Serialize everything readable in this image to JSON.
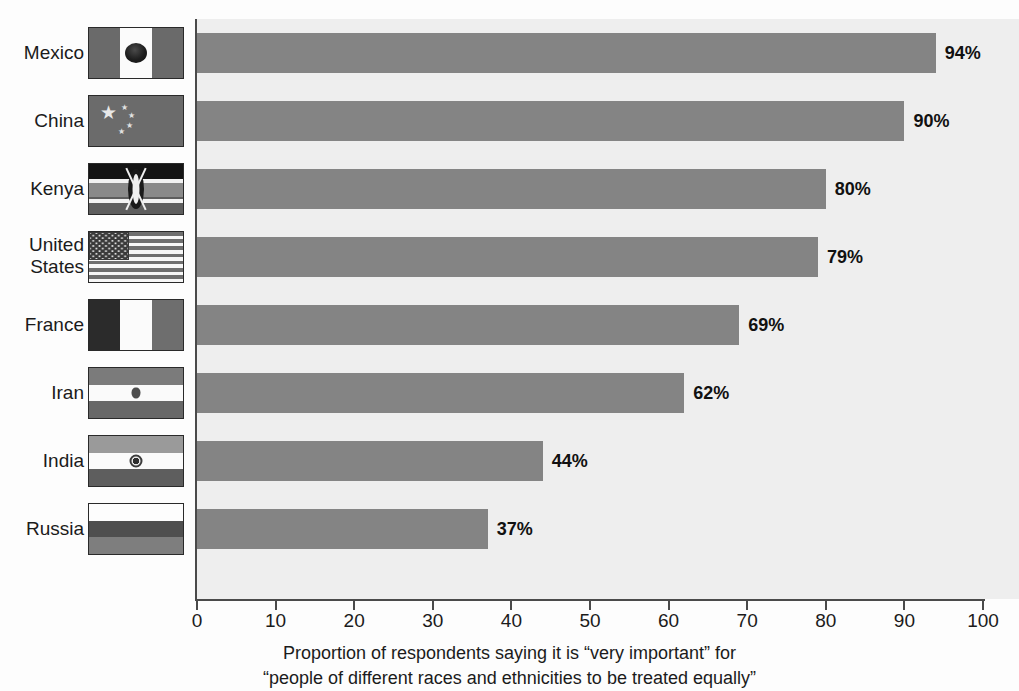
{
  "chart_data": {
    "type": "bar",
    "orientation": "horizontal",
    "title": "",
    "categories": [
      "Mexico",
      "China",
      "Kenya",
      "United States",
      "France",
      "Iran",
      "India",
      "Russia"
    ],
    "values": [
      94,
      90,
      80,
      79,
      69,
      62,
      44,
      37
    ],
    "value_labels": [
      "94%",
      "90%",
      "80%",
      "79%",
      "69%",
      "62%",
      "44%",
      "37%"
    ],
    "xlabel": "Proportion of respondents saying it is “very important” for “people of different races and ethnicities to be treated equally”",
    "ylabel": "",
    "xlim": [
      0,
      100
    ],
    "xticks": [
      0,
      10,
      20,
      30,
      40,
      50,
      60,
      70,
      80,
      90,
      100
    ],
    "xtick_labels": [
      "0",
      "10",
      "20",
      "30",
      "40",
      "50",
      "60",
      "70",
      "80",
      "90",
      "100"
    ],
    "grid": false,
    "legend": "none",
    "bar_color": "#848484",
    "plot_background": "#eeeeee"
  },
  "caption": {
    "line1": "Proportion of respondents saying it is “very important” for",
    "line2": "“people of different races and ethnicities to be treated equally”"
  },
  "rows": [
    {
      "country": "Mexico",
      "country_line1": "Mexico",
      "country_line2": "",
      "value": 94,
      "label": "94%",
      "flag": "flag-mexico"
    },
    {
      "country": "China",
      "country_line1": "China",
      "country_line2": "",
      "value": 90,
      "label": "90%",
      "flag": "flag-china"
    },
    {
      "country": "Kenya",
      "country_line1": "Kenya",
      "country_line2": "",
      "value": 80,
      "label": "80%",
      "flag": "flag-kenya"
    },
    {
      "country": "United States",
      "country_line1": "United",
      "country_line2": "States",
      "value": 79,
      "label": "79%",
      "flag": "flag-usa"
    },
    {
      "country": "France",
      "country_line1": "France",
      "country_line2": "",
      "value": 69,
      "label": "69%",
      "flag": "flag-france"
    },
    {
      "country": "Iran",
      "country_line1": "Iran",
      "country_line2": "",
      "value": 62,
      "label": "62%",
      "flag": "flag-iran"
    },
    {
      "country": "India",
      "country_line1": "India",
      "country_line2": "",
      "value": 44,
      "label": "44%",
      "flag": "flag-india"
    },
    {
      "country": "Russia",
      "country_line1": "Russia",
      "country_line2": "",
      "value": 37,
      "label": "37%",
      "flag": "flag-russia"
    }
  ],
  "axis": {
    "ticks": [
      "0",
      "10",
      "20",
      "30",
      "40",
      "50",
      "60",
      "70",
      "80",
      "90",
      "100"
    ]
  }
}
